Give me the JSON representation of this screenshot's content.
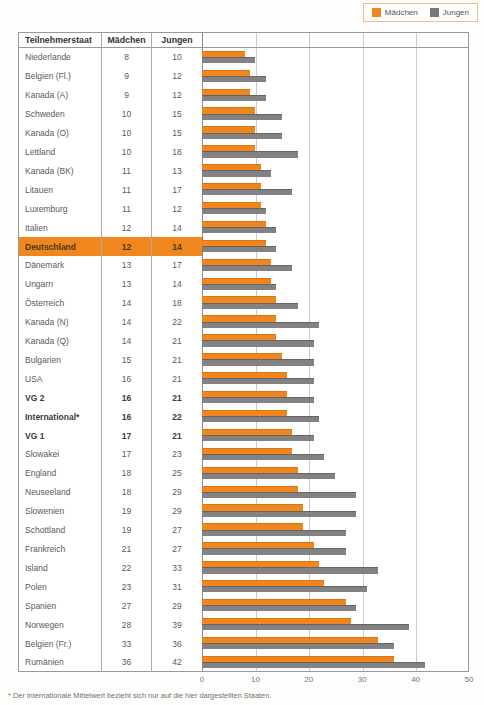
{
  "legend": {
    "items": [
      {
        "label": "Mädchen",
        "color": "#F0861E"
      },
      {
        "label": "Jungen",
        "color": "#787878"
      }
    ]
  },
  "table": {
    "headers": [
      "Teilnehmerstaat",
      "Mädchen",
      "Jungen"
    ]
  },
  "chart_data": {
    "type": "bar",
    "orientation": "horizontal",
    "title": "",
    "xlabel": "",
    "ylabel": "Teilnehmerstaat",
    "xlim": [
      0,
      50
    ],
    "xticks": [
      0,
      10,
      20,
      30,
      40,
      50
    ],
    "grid": true,
    "legend_position": "top-right",
    "highlighted_category": "Deutschland",
    "bold_categories": [
      "VG 2",
      "International*",
      "VG 1"
    ],
    "categories": [
      "Niederlande",
      "Belgien (Fl.)",
      "Kanada (A)",
      "Schweden",
      "Kanada (O)",
      "Lettland",
      "Kanada (BK)",
      "Litauen",
      "Luxemburg",
      "Italien",
      "Deutschland",
      "Dänemark",
      "Ungarn",
      "Österreich",
      "Kanada (N)",
      "Kanada (Q)",
      "Bulgarien",
      "USA",
      "VG 2",
      "International*",
      "VG 1",
      "Slowakei",
      "England",
      "Neuseeland",
      "Slowenien",
      "Schottland",
      "Frankreich",
      "Island",
      "Polen",
      "Spanien",
      "Norwegen",
      "Belgien (Fr.)",
      "Rumänien"
    ],
    "series": [
      {
        "name": "Mädchen",
        "color": "#F0861E",
        "values": [
          8,
          9,
          9,
          10,
          10,
          10,
          11,
          11,
          11,
          12,
          12,
          13,
          13,
          14,
          14,
          14,
          15,
          16,
          16,
          16,
          17,
          17,
          18,
          18,
          19,
          19,
          21,
          22,
          23,
          27,
          28,
          33,
          36
        ]
      },
      {
        "name": "Jungen",
        "color": "#828282",
        "values": [
          10,
          12,
          12,
          15,
          15,
          18,
          13,
          17,
          12,
          14,
          14,
          17,
          14,
          18,
          22,
          21,
          21,
          21,
          21,
          22,
          21,
          23,
          25,
          29,
          29,
          27,
          27,
          33,
          31,
          29,
          39,
          36,
          42
        ]
      }
    ]
  },
  "axis": {
    "ticks": [
      "0",
      "10",
      "20",
      "30",
      "40",
      "50"
    ]
  },
  "footnote": "* Der internationale Mittelwert bezieht sich nur auf die hier dargestellten Staaten."
}
